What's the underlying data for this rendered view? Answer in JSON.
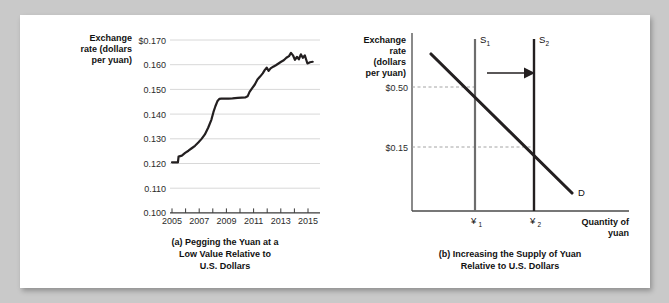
{
  "figure": {
    "background_color": "#c9c9c9",
    "card_color": "#ffffff"
  },
  "panel_a": {
    "caption_line1": "(a) Pegging the Yuan at a",
    "caption_line2": "Low Value Relative to",
    "caption_line3": "U.S. Dollars",
    "y_axis_title_line1": "Exchange",
    "y_axis_title_line2": "rate (dollars",
    "y_axis_title_line3": "per yuan)"
  },
  "panel_b": {
    "caption_line1": "(b) Increasing the Supply of Yuan",
    "caption_line2": "Relative to U.S. Dollars",
    "y_axis_title_line1": "Exchange",
    "y_axis_title_line2": "rate",
    "y_axis_title_line3": "(dollars",
    "y_axis_title_line4": "per yuan)",
    "x_axis_title_line1": "Quantity of",
    "x_axis_title_line2": "yuan",
    "y_tick_high": "$0.50",
    "y_tick_low": "$0.15",
    "supply1_label": "S",
    "supply1_sub": "1",
    "supply2_label": "S",
    "supply2_sub": "2",
    "demand_label": "D",
    "qty1_label": "¥",
    "qty1_sub": "1",
    "qty2_label": "¥",
    "qty2_sub": "2"
  },
  "chart_data": [
    {
      "type": "line",
      "panel": "a",
      "title": "(a) Pegging the Yuan at a Low Value Relative to U.S. Dollars",
      "xlabel": "",
      "ylabel": "Exchange rate (dollars per yuan)",
      "ylim": [
        0.1,
        0.17
      ],
      "xlim": [
        2005,
        2015.8
      ],
      "grid": true,
      "legend": "none",
      "y_tick_labels": [
        "$0.170",
        "0.160",
        "0.150",
        "0.140",
        "0.130",
        "0.120",
        "0.110",
        "0.100"
      ],
      "y_ticks": [
        0.17,
        0.16,
        0.15,
        0.14,
        0.13,
        0.12,
        0.11,
        0.1
      ],
      "x_tick_labels": [
        "2005",
        "2007",
        "2009",
        "2011",
        "2013",
        "2015"
      ],
      "x_ticks": [
        2005,
        2007,
        2009,
        2011,
        2013,
        2015
      ],
      "series": [
        {
          "name": "Exchange rate (dollars per yuan)",
          "color": "#231f20",
          "x": [
            2005.0,
            2005.2,
            2005.45,
            2005.5,
            2005.75,
            2006.0,
            2006.25,
            2006.5,
            2006.75,
            2007.0,
            2007.25,
            2007.5,
            2007.75,
            2008.0,
            2008.15,
            2008.3,
            2008.45,
            2008.6,
            2008.75,
            2009.0,
            2009.3,
            2009.6,
            2010.0,
            2010.3,
            2010.6,
            2010.75,
            2010.9,
            2011.1,
            2011.3,
            2011.5,
            2011.7,
            2011.9,
            2012.05,
            2012.2,
            2012.35,
            2012.5,
            2012.7,
            2012.9,
            2013.1,
            2013.3,
            2013.5,
            2013.7,
            2013.9,
            2014.05,
            2014.2,
            2014.35,
            2014.5,
            2014.65,
            2014.8,
            2014.95,
            2015.1,
            2015.3,
            2015.5,
            2015.7
          ],
          "y": [
            0.1205,
            0.1205,
            0.1205,
            0.1228,
            0.1232,
            0.1243,
            0.1252,
            0.1262,
            0.1272,
            0.1285,
            0.13,
            0.1318,
            0.1345,
            0.1378,
            0.1408,
            0.1432,
            0.1452,
            0.1462,
            0.1463,
            0.1463,
            0.1463,
            0.1464,
            0.1466,
            0.1467,
            0.1468,
            0.1472,
            0.149,
            0.1505,
            0.152,
            0.154,
            0.1552,
            0.1565,
            0.1578,
            0.1588,
            0.1575,
            0.1585,
            0.1592,
            0.1598,
            0.1605,
            0.1612,
            0.1618,
            0.1628,
            0.1635,
            0.1648,
            0.1638,
            0.162,
            0.1632,
            0.1622,
            0.1642,
            0.1628,
            0.1638,
            0.1605,
            0.161,
            0.1612
          ]
        }
      ]
    },
    {
      "type": "line",
      "panel": "b",
      "title": "(b) Increasing the Supply of Yuan Relative to U.S. Dollars",
      "xlabel": "Quantity of yuan",
      "ylabel": "Exchange rate (dollars per yuan)",
      "grid": false,
      "legend": "inline-labels",
      "annotations": [
        "S1",
        "S2",
        "D",
        "shift-arrow"
      ],
      "y_tick_labels": [
        "$0.50",
        "$0.15"
      ],
      "x_tick_labels": [
        "¥1",
        "¥2"
      ],
      "series": [
        {
          "name": "D",
          "type": "demand",
          "color": "#231f20",
          "points": [
            [
              0.12,
              0.93
            ],
            [
              0.84,
              0.13
            ]
          ]
        },
        {
          "name": "S1",
          "type": "supply-vertical",
          "color": "#5a5a5a",
          "x": 0.38
        },
        {
          "name": "S2",
          "type": "supply-vertical",
          "color": "#231f20",
          "x": 0.71
        },
        {
          "name": "equilibrium-1",
          "price": 0.5,
          "quantity": "¥1"
        },
        {
          "name": "equilibrium-2",
          "price": 0.15,
          "quantity": "¥2"
        }
      ]
    }
  ]
}
